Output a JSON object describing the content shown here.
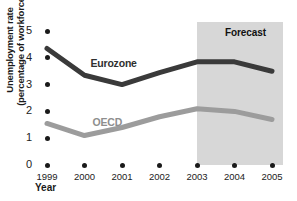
{
  "chart_data": {
    "type": "line",
    "title": "",
    "xlabel": "Year",
    "ylabel_line1": "Unemployment rate",
    "ylabel_line2": "(percentage of workforce)",
    "categories": [
      "1999",
      "2000",
      "2001",
      "2002",
      "2003",
      "2004",
      "2005"
    ],
    "ylim": [
      0,
      5
    ],
    "yticks": [
      "0",
      "1",
      "2",
      "3",
      "4",
      "5"
    ],
    "grid": false,
    "legend_position": "inline-labels",
    "series": [
      {
        "name": "Eurozone",
        "color": "#3a3a3a",
        "values": [
          4.35,
          3.35,
          3.0,
          3.45,
          3.85,
          3.85,
          3.5
        ]
      },
      {
        "name": "OECD",
        "color": "#9c9c9c",
        "values": [
          1.55,
          1.1,
          1.4,
          1.8,
          2.1,
          2.0,
          1.7
        ]
      }
    ],
    "annotations": [
      {
        "name": "forecast-band",
        "label": "Forecast",
        "from": "2003",
        "to": "2005",
        "color": "#d7d7d7"
      }
    ]
  },
  "axes": {
    "y_title_line1": "Unemployment rate",
    "y_title_line2": "(percentage of workforce)",
    "x_title": "Year"
  },
  "labels": {
    "series_eurozone": "Eurozone",
    "series_oecd": "OECD",
    "forecast": "Forecast"
  }
}
